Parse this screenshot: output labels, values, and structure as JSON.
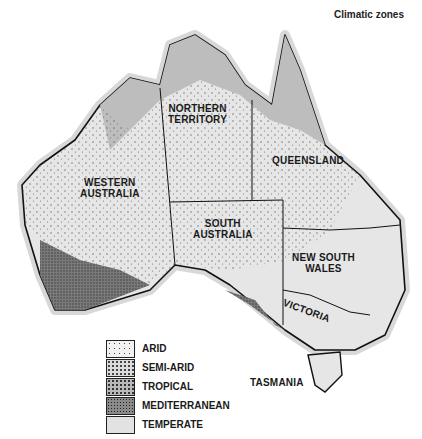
{
  "title": "Climatic zones",
  "regions": [
    {
      "name": "NORTHERN TERRITORY",
      "lines": [
        "NORTHERN",
        "TERRITORY"
      ]
    },
    {
      "name": "QUEENSLAND",
      "lines": [
        "QUEENSLAND"
      ]
    },
    {
      "name": "WESTERN AUSTRALIA",
      "lines": [
        "WESTERN",
        "AUSTRALIA"
      ]
    },
    {
      "name": "SOUTH AUSTRALIA",
      "lines": [
        "SOUTH",
        "AUSTRALIA"
      ]
    },
    {
      "name": "NEW SOUTH WALES",
      "lines": [
        "NEW SOUTH",
        "WALES"
      ]
    },
    {
      "name": "VICTORIA",
      "lines": [
        "VICTORIA"
      ]
    },
    {
      "name": "TASMANIA",
      "lines": [
        "TASMANIA"
      ]
    }
  ],
  "legend": [
    {
      "label": "ARID",
      "color": "#f2f2f2"
    },
    {
      "label": "SEMI-ARID",
      "color": "#dcdcdc"
    },
    {
      "label": "TROPICAL",
      "color": "#b9b9b9"
    },
    {
      "label": "MEDITERRANEAN",
      "color": "#8a8a8a"
    },
    {
      "label": "TEMPERATE",
      "color": "#e2e2e2"
    }
  ]
}
